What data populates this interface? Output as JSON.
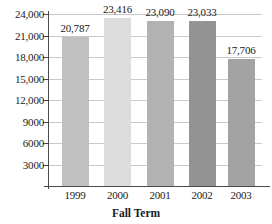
{
  "chart_data": {
    "type": "bar",
    "title": "",
    "xlabel": "Fall Term",
    "ylabel": "",
    "categories": [
      "1999",
      "2000",
      "2001",
      "2002",
      "2003"
    ],
    "values": [
      20787,
      23416,
      23090,
      23033,
      17706
    ],
    "value_labels": [
      "20,787",
      "23,416",
      "23,090",
      "23,033",
      "17,706"
    ],
    "bar_colors": [
      "#c0c0c0",
      "#dcdcdc",
      "#b2b2b2",
      "#949494",
      "#a3a3a3"
    ],
    "ylim": [
      0,
      24000
    ],
    "ytick_values": [
      3000,
      6000,
      9000,
      12000,
      15000,
      18000,
      21000,
      24000
    ],
    "ytick_labels": [
      "3000",
      "6000",
      "9000",
      "12,000",
      "15,000",
      "18,000",
      "21,000",
      "24,000"
    ],
    "grid": true,
    "gridline_color": "#c9c9c9",
    "axis_color": "#4a4a4a",
    "legend": "none",
    "background": "#ffffff"
  }
}
